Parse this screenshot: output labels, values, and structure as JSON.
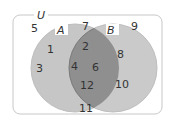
{
  "diagram": {
    "type": "venn",
    "universe_label": "U",
    "sets": [
      {
        "label": "A",
        "only": [
          "1",
          "3"
        ]
      },
      {
        "label": "B",
        "only": [
          "8",
          "10"
        ]
      }
    ],
    "intersection": [
      "2",
      "4",
      "6",
      "12"
    ],
    "outside": [
      "5",
      "7",
      "9",
      "11"
    ],
    "colors": {
      "set_fill": "#c8c8c8",
      "intersection_fill": "#8c8c8c",
      "border": "#b0b0b0",
      "text": "#333333"
    }
  }
}
